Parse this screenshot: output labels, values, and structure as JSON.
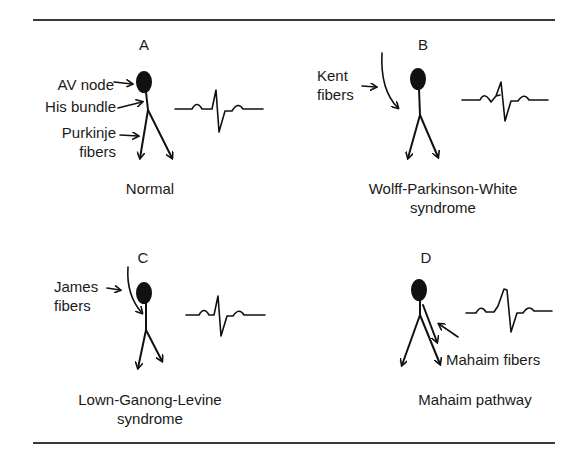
{
  "panels": [
    {
      "letter": "A",
      "caption": [
        "Normal"
      ],
      "labels": {
        "av_node": "AV node",
        "his_bundle": "His bundle",
        "purkinje_1": "Purkinje",
        "purkinje_2": "fibers"
      }
    },
    {
      "letter": "B",
      "caption": [
        "Wolff-Parkinson-White",
        "syndrome"
      ],
      "labels": {
        "kent_1": "Kent",
        "kent_2": "fibers"
      }
    },
    {
      "letter": "C",
      "caption": [
        "Lown-Ganong-Levine",
        "syndrome"
      ],
      "labels": {
        "james_1": "James",
        "james_2": "fibers"
      }
    },
    {
      "letter": "D",
      "caption": [
        "Mahaim pathway"
      ],
      "labels": {
        "mahaim": "Mahaim fibers"
      }
    }
  ]
}
